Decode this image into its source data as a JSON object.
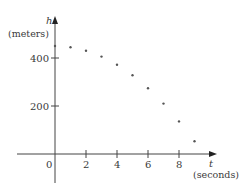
{
  "chart_data": {
    "type": "scatter",
    "title": "",
    "xlabel": "t",
    "xlabel_unit": "(seconds)",
    "ylabel": "h",
    "ylabel_unit": "(meters)",
    "x_ticks": [
      0,
      2,
      4,
      6,
      8
    ],
    "y_ticks": [
      200,
      400
    ],
    "xlim": [
      -1.5,
      10
    ],
    "ylim": [
      -60,
      470
    ],
    "grid": false,
    "legend": null,
    "series": [
      {
        "name": "height",
        "x": [
          0,
          1,
          2,
          3,
          4,
          5,
          6,
          7,
          8,
          9
        ],
        "y": [
          450,
          445,
          430,
          406,
          372,
          328,
          274,
          210,
          136,
          53
        ]
      }
    ]
  },
  "labels": {
    "origin": "0",
    "x_tick_2": "2",
    "x_tick_4": "4",
    "x_tick_6": "6",
    "x_tick_8": "8",
    "y_tick_200": "200",
    "y_tick_400": "400",
    "x_axis_name": "t",
    "x_axis_unit": "(seconds)",
    "y_axis_name": "h",
    "y_axis_unit": "(meters)"
  },
  "colors": {
    "axis": "#444444",
    "points": "#555555",
    "text": "#3a3a3a"
  }
}
